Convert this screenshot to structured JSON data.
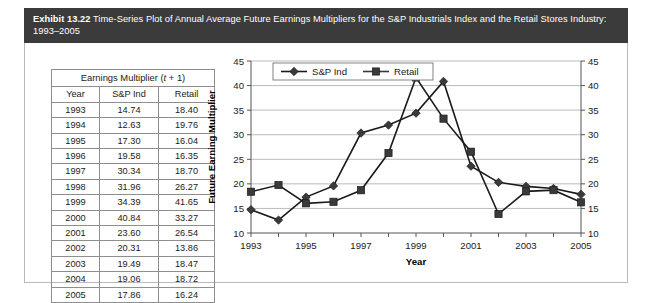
{
  "exhibit": {
    "label": "Exhibit 13.22",
    "caption": "Time-Series Plot of Annual Average Future Earnings Multipliers for the S&P Industrials Index and the Retail Stores Industry: 1993–2005"
  },
  "table": {
    "title_prefix": "Earnings Multiplier (",
    "title_italic": "t",
    "title_suffix": " + 1)",
    "title_full": "Earnings Multiplier (t + 1)",
    "headers": [
      "Year",
      "S&P Ind",
      "Retail"
    ],
    "rows": [
      [
        "1993",
        "14.74",
        "18.40"
      ],
      [
        "1994",
        "12.63",
        "19.76"
      ],
      [
        "1995",
        "17.30",
        "16.04"
      ],
      [
        "1996",
        "19.58",
        "16.35"
      ],
      [
        "1997",
        "30.34",
        "18.70"
      ],
      [
        "1998",
        "31.96",
        "26.27"
      ],
      [
        "1999",
        "34.39",
        "41.65"
      ],
      [
        "2000",
        "40.84",
        "33.27"
      ],
      [
        "2001",
        "23.60",
        "26.54"
      ],
      [
        "2002",
        "20.31",
        "13.86"
      ],
      [
        "2003",
        "19.49",
        "18.47"
      ],
      [
        "2004",
        "19.06",
        "18.72"
      ],
      [
        "2005",
        "17.86",
        "16.24"
      ]
    ]
  },
  "chart_data": {
    "type": "line",
    "title": "",
    "xlabel": "Year",
    "ylabel": "Future Earning Multiplier",
    "ylabel_right": "",
    "x": [
      1993,
      1994,
      1995,
      1996,
      1997,
      1998,
      1999,
      2000,
      2001,
      2002,
      2003,
      2004,
      2005
    ],
    "xtick_labels": [
      "1993",
      "1995",
      "1997",
      "1999",
      "2001",
      "2003",
      "2005"
    ],
    "xtick_values": [
      1993,
      1995,
      1997,
      1999,
      2001,
      2003,
      2005
    ],
    "xlim": [
      1993,
      2005
    ],
    "ylim": [
      10,
      45
    ],
    "ytick_values": [
      10,
      15,
      20,
      25,
      30,
      35,
      40,
      45
    ],
    "ytick_labels": [
      "10",
      "15",
      "20",
      "25",
      "30",
      "35",
      "40",
      "45"
    ],
    "right_axis": true,
    "grid": "horizontal",
    "legend_position": "top-left",
    "series": [
      {
        "name": "S&P Ind",
        "marker": "diamond",
        "color": "#1a1a1a",
        "values": [
          14.74,
          12.63,
          17.3,
          19.58,
          30.34,
          31.96,
          34.39,
          40.84,
          23.6,
          20.31,
          19.49,
          19.06,
          17.86
        ]
      },
      {
        "name": "Retail",
        "marker": "square",
        "color": "#3a3a3a",
        "values": [
          18.4,
          19.76,
          16.04,
          16.35,
          18.7,
          26.27,
          41.65,
          33.27,
          26.54,
          13.86,
          18.47,
          18.72,
          16.24
        ]
      }
    ]
  },
  "colors": {
    "header_bg": "#3b3b3b",
    "header_fg": "#ffffff",
    "frame_border": "#b9b9b9",
    "grid": "#aaaaaa",
    "series_1": "#1a1a1a",
    "series_2": "#3a3a3a"
  }
}
